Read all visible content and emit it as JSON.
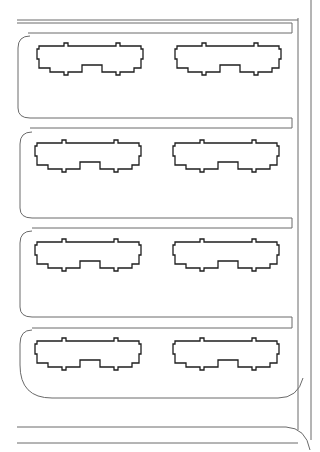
{
  "diagram": {
    "type": "site-plan",
    "colors": {
      "background": "#ffffff",
      "road_line": "#6a6a6a",
      "building_outline": "#1e1e1e"
    },
    "blocks": [
      {
        "id": "block-1",
        "buildings": [
          "building-1a",
          "building-1b"
        ]
      },
      {
        "id": "block-2",
        "buildings": [
          "building-2a",
          "building-2b"
        ]
      },
      {
        "id": "block-3",
        "buildings": [
          "building-3a",
          "building-3b"
        ]
      },
      {
        "id": "block-4",
        "buildings": [
          "building-4a",
          "building-4b"
        ]
      }
    ],
    "building_count": 8,
    "block_count": 4
  }
}
